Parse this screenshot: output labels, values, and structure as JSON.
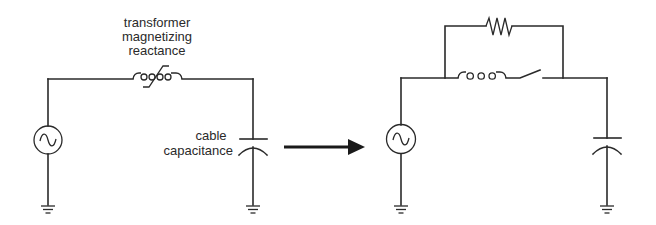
{
  "diagram": {
    "type": "circuit-schematic",
    "left_circuit": {
      "labels": {
        "inductor_line1": "transformer",
        "inductor_line2": "magnetizing",
        "inductor_line3": "reactance",
        "capacitor_line1": "cable",
        "capacitor_line2": "capacitance"
      },
      "components": [
        "ac-source",
        "nonlinear-inductor",
        "capacitor",
        "ground",
        "ground"
      ]
    },
    "transition": "arrow-right",
    "right_circuit": {
      "components": [
        "ac-source",
        "inductor",
        "open-switch",
        "resistor-parallel",
        "capacitor",
        "ground",
        "ground"
      ]
    },
    "colors": {
      "line": "#2a2a2a",
      "background": "#ffffff"
    }
  }
}
